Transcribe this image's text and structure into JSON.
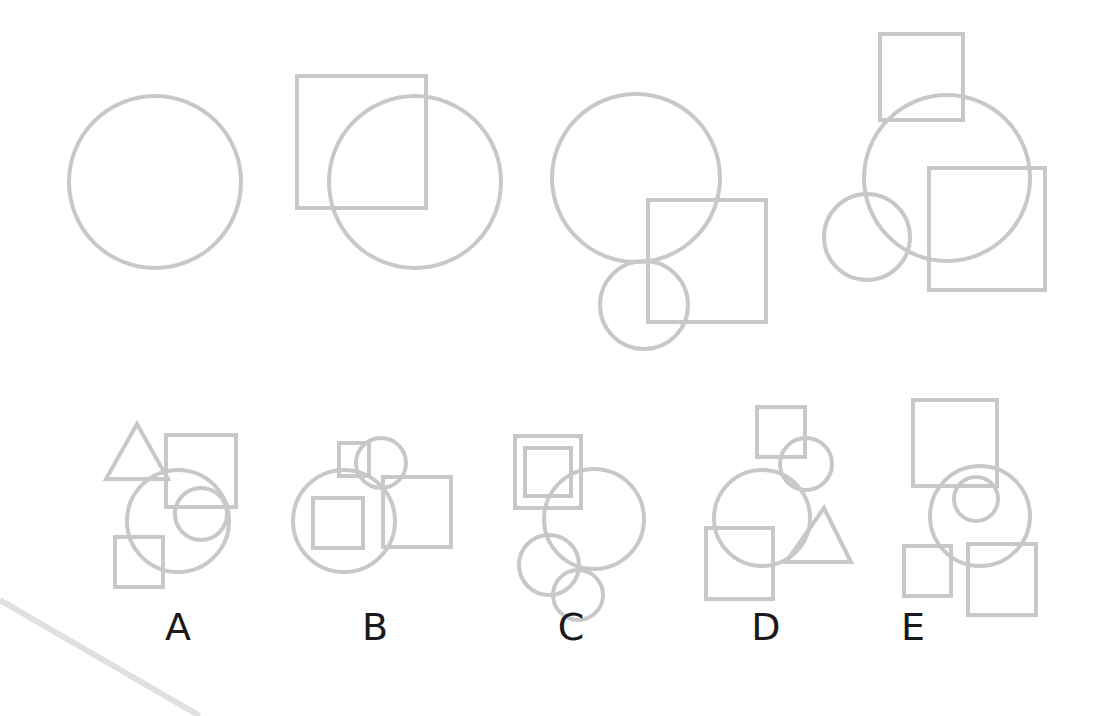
{
  "style": {
    "stroke": "#c8c8c8",
    "stroke_width": 4,
    "label_color": "#1a1a1a",
    "background": "#ffffff"
  },
  "sequence": [
    {
      "id": "seq-1",
      "shapes": [
        {
          "type": "circle",
          "cx": 155,
          "cy": 182,
          "r": 86
        }
      ]
    },
    {
      "id": "seq-2",
      "shapes": [
        {
          "type": "rect",
          "x": 297,
          "y": 76,
          "w": 129,
          "h": 132
        },
        {
          "type": "circle",
          "cx": 415,
          "cy": 182,
          "r": 86
        }
      ]
    },
    {
      "id": "seq-3",
      "shapes": [
        {
          "type": "circle",
          "cx": 636,
          "cy": 178,
          "r": 84
        },
        {
          "type": "rect",
          "x": 648,
          "y": 200,
          "w": 118,
          "h": 122
        },
        {
          "type": "circle",
          "cx": 644,
          "cy": 305,
          "r": 44
        }
      ]
    },
    {
      "id": "seq-4",
      "shapes": [
        {
          "type": "rect",
          "x": 880,
          "y": 34,
          "w": 83,
          "h": 86
        },
        {
          "type": "circle",
          "cx": 947,
          "cy": 178,
          "r": 83
        },
        {
          "type": "rect",
          "x": 929,
          "y": 168,
          "w": 116,
          "h": 122
        },
        {
          "type": "circle",
          "cx": 867,
          "cy": 237,
          "r": 43
        }
      ]
    }
  ],
  "options": [
    {
      "label": "A",
      "label_x": 178,
      "label_y": 640,
      "shapes": [
        {
          "type": "triangle",
          "points": "137,424 106,479 168,479"
        },
        {
          "type": "rect",
          "x": 166,
          "y": 435,
          "w": 70,
          "h": 72
        },
        {
          "type": "circle",
          "cx": 178,
          "cy": 521,
          "r": 51
        },
        {
          "type": "circle",
          "cx": 201,
          "cy": 514,
          "r": 26
        },
        {
          "type": "rect",
          "x": 115,
          "y": 537,
          "w": 48,
          "h": 50
        }
      ]
    },
    {
      "label": "B",
      "label_x": 375,
      "label_y": 640,
      "shapes": [
        {
          "type": "rect",
          "x": 339,
          "y": 443,
          "w": 30,
          "h": 33
        },
        {
          "type": "circle",
          "cx": 381,
          "cy": 463,
          "r": 25
        },
        {
          "type": "circle",
          "cx": 344,
          "cy": 521,
          "r": 51
        },
        {
          "type": "rect",
          "x": 313,
          "y": 498,
          "w": 50,
          "h": 50
        },
        {
          "type": "rect",
          "x": 383,
          "y": 477,
          "w": 68,
          "h": 70
        }
      ]
    },
    {
      "label": "C",
      "label_x": 571,
      "label_y": 640,
      "shapes": [
        {
          "type": "rect",
          "x": 515,
          "y": 436,
          "w": 66,
          "h": 72
        },
        {
          "type": "rect",
          "x": 525,
          "y": 448,
          "w": 46,
          "h": 48
        },
        {
          "type": "circle",
          "cx": 594,
          "cy": 519,
          "r": 50
        },
        {
          "type": "circle",
          "cx": 549,
          "cy": 565,
          "r": 30
        },
        {
          "type": "circle",
          "cx": 578,
          "cy": 595,
          "r": 25
        }
      ]
    },
    {
      "label": "D",
      "label_x": 766,
      "label_y": 640,
      "shapes": [
        {
          "type": "rect",
          "x": 757,
          "y": 407,
          "w": 48,
          "h": 50
        },
        {
          "type": "circle",
          "cx": 806,
          "cy": 464,
          "r": 26
        },
        {
          "type": "circle",
          "cx": 762,
          "cy": 518,
          "r": 48
        },
        {
          "type": "rect",
          "x": 706,
          "y": 528,
          "w": 67,
          "h": 71
        },
        {
          "type": "triangle",
          "points": "824,508 786,562 851,562"
        }
      ]
    },
    {
      "label": "E",
      "label_x": 913,
      "label_y": 640,
      "shapes": [
        {
          "type": "rect",
          "x": 913,
          "y": 400,
          "w": 84,
          "h": 86
        },
        {
          "type": "circle",
          "cx": 980,
          "cy": 516,
          "r": 50
        },
        {
          "type": "circle",
          "cx": 976,
          "cy": 499,
          "r": 22
        },
        {
          "type": "rect",
          "x": 904,
          "y": 546,
          "w": 47,
          "h": 50
        },
        {
          "type": "rect",
          "x": 968,
          "y": 544,
          "w": 68,
          "h": 71
        }
      ]
    }
  ],
  "decoration": {
    "type": "line",
    "x1": 0,
    "y1": 600,
    "x2": 200,
    "y2": 716,
    "stroke": "#e0e0e0",
    "stroke_width": 6
  }
}
